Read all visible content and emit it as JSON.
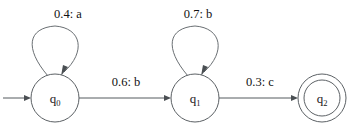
{
  "figure": {
    "background_color": "#ffffff",
    "line_color": "#5c6165",
    "text_color": "#111111"
  },
  "states": [
    {
      "id": "q0",
      "name": "q",
      "subscript": "0",
      "accepting": false,
      "is_start": true,
      "cx": 55,
      "cy": 98,
      "r": 24
    },
    {
      "id": "q1",
      "name": "q",
      "subscript": "1",
      "accepting": false,
      "is_start": false,
      "cx": 195,
      "cy": 98,
      "r": 24
    },
    {
      "id": "q2",
      "name": "q",
      "subscript": "2",
      "accepting": true,
      "is_start": false,
      "cx": 322,
      "cy": 98,
      "r": 24,
      "r_inner": 18
    }
  ],
  "transitions": [
    {
      "id": "t-q0-q0",
      "from": "q0",
      "to": "q0",
      "kind": "self-loop",
      "probability": "0.4",
      "symbol": "a",
      "label": "0.4: a",
      "label_x": 68,
      "label_y": 18
    },
    {
      "id": "t-q0-q1",
      "from": "q0",
      "to": "q1",
      "kind": "straight",
      "probability": "0.6",
      "symbol": "b",
      "label": "0.6: b",
      "label_x": 126,
      "label_y": 86
    },
    {
      "id": "t-q1-q1",
      "from": "q1",
      "to": "q1",
      "kind": "self-loop",
      "probability": "0.7",
      "symbol": "b",
      "label": "0.7: b",
      "label_x": 198,
      "label_y": 18
    },
    {
      "id": "t-q1-q2",
      "from": "q1",
      "to": "q2",
      "kind": "straight",
      "probability": "0.3",
      "symbol": "c",
      "label": "0.3: c",
      "label_x": 260,
      "label_y": 86
    }
  ],
  "start_marker": {
    "id": "start-arrow",
    "from_x": 3,
    "to_x": 30,
    "y": 98
  }
}
